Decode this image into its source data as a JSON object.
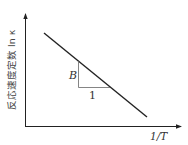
{
  "diagram": {
    "y_axis_label": "反応速度定数 ln κ",
    "x_axis_label": "1/T",
    "slope_rise_label": "B",
    "slope_run_label": "1",
    "line_color": "#222222",
    "axis_color": "#222222",
    "triangle_color": "#666666"
  }
}
